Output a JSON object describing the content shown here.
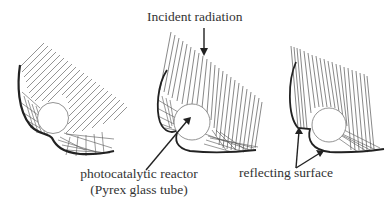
{
  "figure": {
    "labels": {
      "incident": "Incident radiation",
      "reactor_line1": "photocatalytic reactor",
      "reactor_line2": "(Pyrex glass tube)",
      "reflector": "reflecting surface"
    },
    "panels": [
      {
        "id": "left",
        "description": "involute-type reflector with tilted incident rays"
      },
      {
        "id": "middle",
        "description": "compound parabolic reflector with near-vertical incident rays"
      },
      {
        "id": "right",
        "description": "compound parabolic reflector with vertical incident rays"
      }
    ],
    "colors": {
      "lines": "#555555",
      "reflector": "#222222",
      "text": "#333333"
    }
  }
}
